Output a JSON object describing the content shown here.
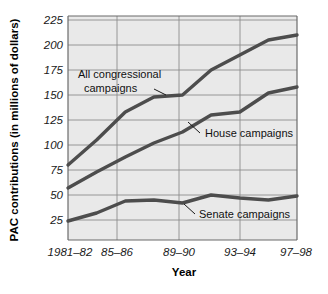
{
  "chart_data": {
    "type": "line",
    "title": "",
    "xlabel": "Year",
    "ylabel": "PAC contributions (in millions of dollars)",
    "categories": [
      "1981–82",
      "83–84",
      "85–86",
      "87–88",
      "89–90",
      "91–92",
      "93–94",
      "95–96",
      "97–98"
    ],
    "xtick_labels": [
      "1981–82",
      "85–86",
      "89–90",
      "93–94",
      "97–98"
    ],
    "ytick_labels": [
      "25",
      "50",
      "75",
      "100",
      "125",
      "150",
      "175",
      "200",
      "225"
    ],
    "yticks": [
      25,
      50,
      75,
      100,
      125,
      150,
      175,
      200,
      225
    ],
    "ylim": [
      5,
      232
    ],
    "grid": true,
    "legend": "inline-annotations",
    "series": [
      {
        "name": "All congressional campaigns",
        "label": "All congressional\ncampaigns",
        "values": [
          80,
          105,
          133,
          148,
          150,
          175,
          190,
          205,
          210
        ],
        "color": "#4d4d4d"
      },
      {
        "name": "House campaigns",
        "label": "House campaigns",
        "values": [
          57,
          73,
          88,
          102,
          113,
          130,
          133,
          152,
          158
        ],
        "color": "#4d4d4d"
      },
      {
        "name": "Senate campaigns",
        "label": "Senate campaigns",
        "values": [
          24,
          32,
          44,
          45,
          42,
          50,
          47,
          45,
          49
        ],
        "color": "#4d4d4d"
      }
    ]
  },
  "axes": {
    "x_axis_title": "Year",
    "y_axis_title": "PAC contributions (in millions of dollars)"
  },
  "annotations": [
    {
      "name": "all-congressional-campaigns-label",
      "line1": "All congressional",
      "line2": "campaigns"
    },
    {
      "name": "house-campaigns-label",
      "text": "House campaigns"
    },
    {
      "name": "senate-campaigns-label",
      "text": "Senate campaigns"
    }
  ],
  "colors": {
    "plot_background": "#e8e8e8",
    "grid_line": "#8f8f8f",
    "axis_line": "#6b6b6b",
    "series_line": "#4d4d4d",
    "text": "#1a1a1a",
    "page_background": "#ffffff"
  }
}
